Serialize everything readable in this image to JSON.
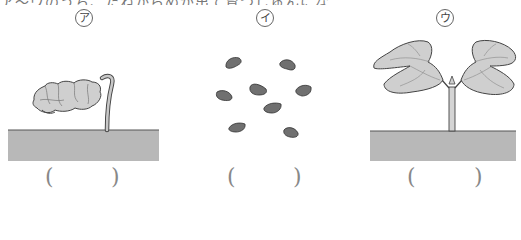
{
  "top_text": "ア〜ウのうち、たねからめが出て育つじゅんにならべなさい。",
  "panels": [
    {
      "id": "a",
      "label": "ア",
      "description": "sprout with crumpled seed leaves emerging from soil",
      "answer_open": "(",
      "answer_close": ")"
    },
    {
      "id": "i",
      "label": "イ",
      "description": "scattered seeds",
      "answer_open": "(",
      "answer_close": ")"
    },
    {
      "id": "u",
      "label": "ウ",
      "description": "seedling with two open seed leaves",
      "answer_open": "(",
      "answer_close": ")"
    }
  ],
  "colors": {
    "soil": "#b8b8b8",
    "soil_edge": "#555555",
    "leaf": "#cfcfcf",
    "seed": "#707070",
    "outline": "#444444"
  }
}
